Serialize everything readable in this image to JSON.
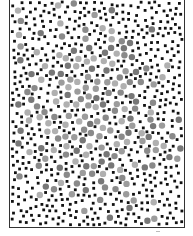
{
  "figure": {
    "frame": {
      "x": 9,
      "y": 0,
      "width": 176,
      "height": 228,
      "stroke": "#333333"
    },
    "black_dots": {
      "count": 820,
      "radius": 1.4,
      "color": "#111111",
      "min_spacing": 5.2
    },
    "grey_dots": {
      "count": 190,
      "radius": 3.2,
      "colors": [
        "#8a8a8a",
        "#9c9c9c",
        "#b0b0b0",
        "#777777"
      ],
      "center": [
        95,
        110
      ],
      "spread": 45,
      "min_spacing": 7
    },
    "seed": 12345
  }
}
